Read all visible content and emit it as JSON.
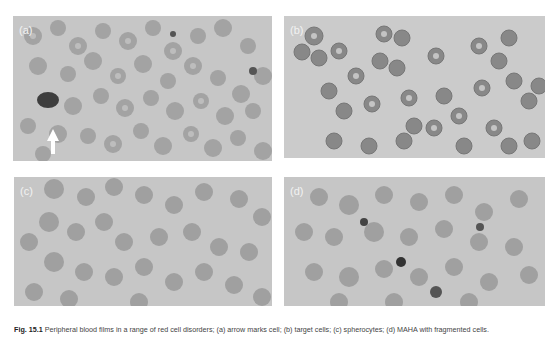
{
  "figure": {
    "panels": [
      {
        "label": "(a)",
        "description": "Blood smear with red cells, a neutrophil and arrow marker"
      },
      {
        "label": "(b)",
        "description": "Blood smear with target-like red cells"
      },
      {
        "label": "(c)",
        "description": "Blood smear with red cells"
      },
      {
        "label": "(d)",
        "description": "Blood smear with red cells and nucleated cells"
      }
    ],
    "caption": {
      "number": "Fig. 15.1",
      "text": "Peripheral blood films in a range of red cell disorders; (a) arrow marks cell; (b) target cells; (c) spherocytes; (d) MAHA with fragmented cells."
    }
  },
  "colors": {
    "background": "#ffffff",
    "smear": "#c9c9c9",
    "cell": "#9e9e9e",
    "dark_cell": "#3a3a3a",
    "label": "#f2f2f2"
  }
}
